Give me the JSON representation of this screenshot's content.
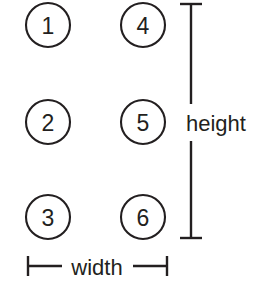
{
  "figure": {
    "background_color": "#ffffff",
    "stroke_color": "#231f20",
    "width_px": 256,
    "height_px": 282
  },
  "nodes": [
    {
      "label": "1",
      "column": 1,
      "row": 1,
      "cx": 48,
      "cy": 25,
      "r": 22
    },
    {
      "label": "2",
      "column": 1,
      "row": 2,
      "cx": 48,
      "cy": 122,
      "r": 22
    },
    {
      "label": "3",
      "column": 1,
      "row": 3,
      "cx": 48,
      "cy": 217,
      "r": 22
    },
    {
      "label": "4",
      "column": 2,
      "row": 1,
      "cx": 143,
      "cy": 25,
      "r": 22
    },
    {
      "label": "5",
      "column": 2,
      "row": 2,
      "cx": 143,
      "cy": 122,
      "r": 22
    },
    {
      "label": "6",
      "column": 2,
      "row": 3,
      "cx": 143,
      "cy": 217,
      "r": 22
    }
  ],
  "dimensions": {
    "height": {
      "label": "height",
      "orientation": "vertical",
      "line_x": 191,
      "start": 4,
      "end": 238,
      "gap_start": 104,
      "gap_end": 141,
      "cap_half_length": 11,
      "label_x": 186,
      "label_y": 123
    },
    "width": {
      "label": "width",
      "orientation": "horizontal",
      "line_y": 266,
      "start": 28,
      "end": 167,
      "gap_start": 62,
      "gap_end": 133,
      "cap_half_length": 10,
      "label_x": 97,
      "label_y": 267
    }
  }
}
